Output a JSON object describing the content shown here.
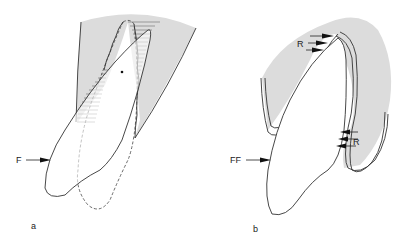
{
  "figure": {
    "panels": [
      {
        "id": "a",
        "caption": "a",
        "force_label": "F",
        "description": "Tooth tipping under force F around center of rotation; original position dashed, bone with hatched compression zones"
      },
      {
        "id": "b",
        "caption": "b",
        "force_label": "FF",
        "resorption_label_upper": "R",
        "resorption_label_lower": "R",
        "description": "Tooth in alveolus with resorption arrows R on opposite sides under force FF"
      }
    ],
    "colors": {
      "bone": "#dcdcdc",
      "line": "#333333",
      "background": "#ffffff"
    }
  }
}
